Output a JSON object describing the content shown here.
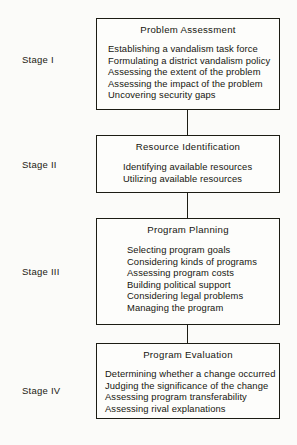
{
  "diagram": {
    "accent_color": "#1c1c14",
    "background_color": "#fbfbf9",
    "stages": [
      {
        "stage_label": "Stage I",
        "box_title": "Problem Assessment",
        "items": [
          "Establishing a vandalism task force",
          "Formulating a district vandalism policy",
          "Assessing the extent of the problem",
          "Assessing the impact of the problem",
          "Uncovering security gaps"
        ]
      },
      {
        "stage_label": "Stage II",
        "box_title": "Resource Identification",
        "items": [
          "Identifying available resources",
          "Utilizing available resources"
        ]
      },
      {
        "stage_label": "Stage III",
        "box_title": "Program Planning",
        "items": [
          "Selecting program goals",
          "Considering kinds of programs",
          "Assessing program costs",
          "Building political support",
          "Considering legal problems",
          "Managing the program"
        ]
      },
      {
        "stage_label": "Stage IV",
        "box_title": "Program Evaluation",
        "items": [
          "Determining whether a change occurred",
          "Judging the significance of the change",
          "Assessing program transferability",
          "Assessing rival explanations"
        ]
      }
    ]
  }
}
